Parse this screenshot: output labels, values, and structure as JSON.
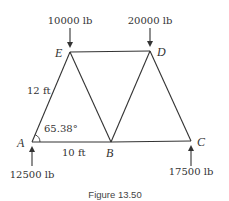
{
  "figure": {
    "caption": "Figure 13.50",
    "nodes": {
      "A": {
        "label": "A",
        "x": 32,
        "y": 142
      },
      "B": {
        "label": "B",
        "x": 111,
        "y": 142
      },
      "C": {
        "label": "C",
        "x": 191,
        "y": 141
      },
      "D": {
        "label": "D",
        "x": 150,
        "y": 51
      },
      "E": {
        "label": "E",
        "x": 70,
        "y": 52
      }
    },
    "members": [
      "A-E",
      "E-B",
      "B-D",
      "D-C",
      "A-B",
      "B-C",
      "E-D"
    ],
    "loads": {
      "E": {
        "value": "10000 lb",
        "direction": "down"
      },
      "D": {
        "value": "20000 lb",
        "direction": "down"
      }
    },
    "reactions": {
      "A": {
        "value": "12500 lb",
        "direction": "up"
      },
      "C": {
        "value": "17500 lb",
        "direction": "up"
      }
    },
    "dimensions": {
      "AE_length": "12 ft",
      "AB_length": "10 ft",
      "angle_A": "65.38°"
    },
    "colors": {
      "line": "#333333",
      "text": "#333333"
    }
  }
}
